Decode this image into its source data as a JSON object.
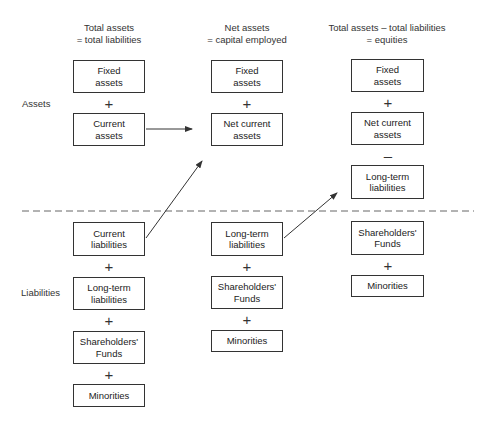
{
  "columns": [
    {
      "header": [
        "Total assets",
        "= total liabilities"
      ],
      "boxes": [
        [
          "Fixed",
          "assets"
        ],
        [
          "Current",
          "assets"
        ],
        [
          "Current",
          "liabilities"
        ],
        [
          "Long-term",
          "liabilities"
        ],
        [
          "Shareholders'",
          "Funds"
        ],
        [
          "Minorities"
        ]
      ],
      "operators": [
        "+",
        "+",
        "+",
        "+"
      ]
    },
    {
      "header": [
        "Net assets",
        "= capital employed"
      ],
      "boxes": [
        [
          "Fixed",
          "assets"
        ],
        [
          "Net current",
          "assets"
        ],
        [
          "Long-term",
          "liabilities"
        ],
        [
          "Shareholders'",
          "Funds"
        ],
        [
          "Minorities"
        ]
      ],
      "operators": [
        "+",
        "+",
        "+"
      ]
    },
    {
      "header": [
        "Total assets – total liabilities",
        "= equities"
      ],
      "boxes": [
        [
          "Fixed",
          "assets"
        ],
        [
          "Net current",
          "assets"
        ],
        [
          "Long-term",
          "liabilities"
        ],
        [
          "Shareholders'",
          "Funds"
        ],
        [
          "Minorities"
        ]
      ],
      "operators": [
        "+",
        "–",
        "+"
      ]
    }
  ],
  "side_labels": {
    "assets": "Assets",
    "liabilities": "Liabilities"
  },
  "colors": {
    "line": "#333333",
    "dash": "#666666"
  }
}
